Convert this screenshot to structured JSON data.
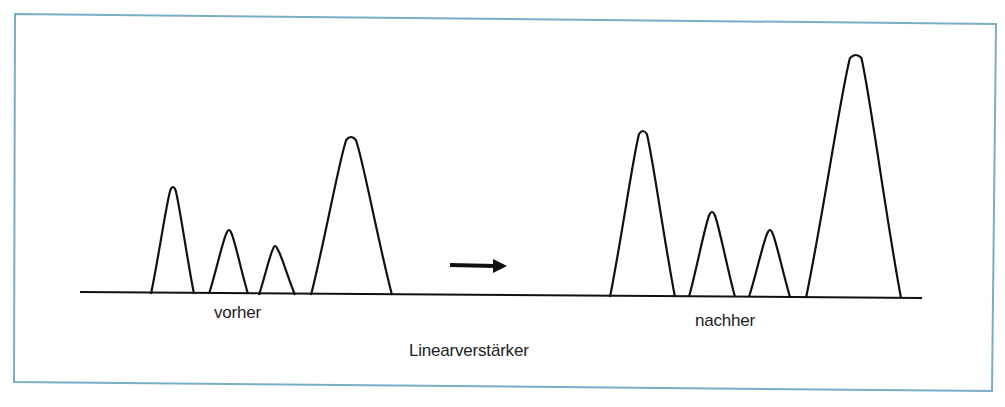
{
  "figure": {
    "frame_color": "#7aaec8",
    "ink_color": "#111111",
    "label_before": "vorher",
    "label_after": "nachher",
    "label_title": "Linearverstärker",
    "caption_visible": ""
  },
  "diagram": {
    "baseline": {
      "x1": 80,
      "y1": 292,
      "x2": 922,
      "y2": 298
    },
    "arrow": {
      "x1": 450,
      "y1": 265,
      "x2": 507,
      "y2": 266
    },
    "peaks_before": [
      {
        "left": 151,
        "apex_x": 173,
        "apex_y": 187,
        "right": 194,
        "base_y": 294
      },
      {
        "left": 209,
        "apex_x": 229,
        "apex_y": 230,
        "right": 248,
        "base_y": 294
      },
      {
        "left": 259,
        "apex_x": 275,
        "apex_y": 246,
        "right": 295,
        "base_y": 295
      },
      {
        "left": 311,
        "apex_x": 351,
        "apex_y": 137,
        "right": 392,
        "base_y": 295
      }
    ],
    "peaks_after": [
      {
        "left": 610,
        "apex_x": 643,
        "apex_y": 131,
        "right": 675,
        "base_y": 297
      },
      {
        "left": 689,
        "apex_x": 712,
        "apex_y": 212,
        "right": 735,
        "base_y": 297
      },
      {
        "left": 749,
        "apex_x": 770,
        "apex_y": 230,
        "right": 790,
        "base_y": 297
      },
      {
        "left": 806,
        "apex_x": 856,
        "apex_y": 55,
        "right": 901,
        "base_y": 298
      }
    ]
  }
}
